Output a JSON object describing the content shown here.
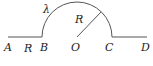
{
  "diagram": {
    "stroke_color": "#555555",
    "label_color": "#222222",
    "points": {
      "A": {
        "label": "A",
        "x": 8,
        "y": 37
      },
      "B": {
        "label": "B",
        "x": 42,
        "y": 37
      },
      "O": {
        "label": "O",
        "x": 77,
        "y": 37
      },
      "C": {
        "label": "C",
        "x": 111,
        "y": 37
      },
      "D": {
        "label": "D",
        "x": 147,
        "y": 37
      }
    },
    "labels": {
      "A": "A",
      "B": "B",
      "O": "O",
      "C": "C",
      "D": "D",
      "AB_length": "R",
      "radius": "R",
      "arc_charge_density": "λ"
    },
    "segments": [
      {
        "name": "AB",
        "from": "A",
        "to": "B"
      },
      {
        "name": "CD",
        "from": "C",
        "to": "D"
      },
      {
        "name": "radius-OP",
        "from": "O",
        "to": "P"
      }
    ],
    "arc": {
      "name": "semicircle-BC",
      "center": "O",
      "radius_px": 35
    }
  }
}
